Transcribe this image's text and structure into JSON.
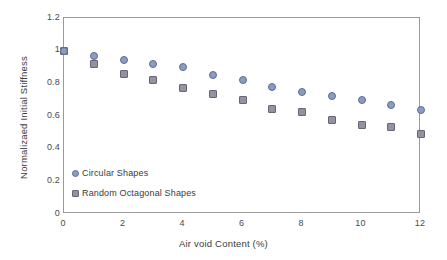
{
  "chart_data": {
    "type": "scatter",
    "title": "",
    "xlabel": "Air void Content (%)",
    "ylabel": "Normalizaed  Initial Stiffness",
    "xlim": [
      0,
      12
    ],
    "ylim": [
      0,
      1.2
    ],
    "xticks": [
      "0",
      "2",
      "4",
      "6",
      "8",
      "10",
      "12"
    ],
    "xtick_values": [
      0,
      2,
      4,
      6,
      8,
      10,
      12
    ],
    "yticks": [
      "0",
      "0.2",
      "0.4",
      "0.6",
      "0.8",
      "1",
      "1.2"
    ],
    "ytick_values": [
      0,
      0.2,
      0.4,
      0.6,
      0.8,
      1,
      1.2
    ],
    "grid": false,
    "legend_position": "lower-left-inside",
    "x": [
      0,
      1,
      2,
      3,
      4,
      5,
      6,
      7,
      8,
      9,
      10,
      11,
      12
    ],
    "series": [
      {
        "name": "Circular Shapes",
        "marker": "circle",
        "color": "#8b9cc0",
        "edge_color": "#5d6d92",
        "values": [
          1.0,
          0.97,
          0.945,
          0.92,
          0.9,
          0.85,
          0.82,
          0.78,
          0.75,
          0.725,
          0.7,
          0.665,
          0.635
        ]
      },
      {
        "name": "Random Octagonal Shapes",
        "marker": "square",
        "color": "#97909f",
        "edge_color": "#6a6478",
        "values": [
          1.0,
          0.92,
          0.86,
          0.82,
          0.77,
          0.735,
          0.695,
          0.645,
          0.625,
          0.575,
          0.545,
          0.53,
          0.49
        ]
      }
    ]
  },
  "legend": {
    "items": [
      {
        "label": "Circular Shapes"
      },
      {
        "label": "Random Octagonal Shapes"
      }
    ]
  },
  "axes": {
    "x_title": "Air void Content (%)",
    "y_title": "Normalizaed  Initial Stiffness"
  }
}
